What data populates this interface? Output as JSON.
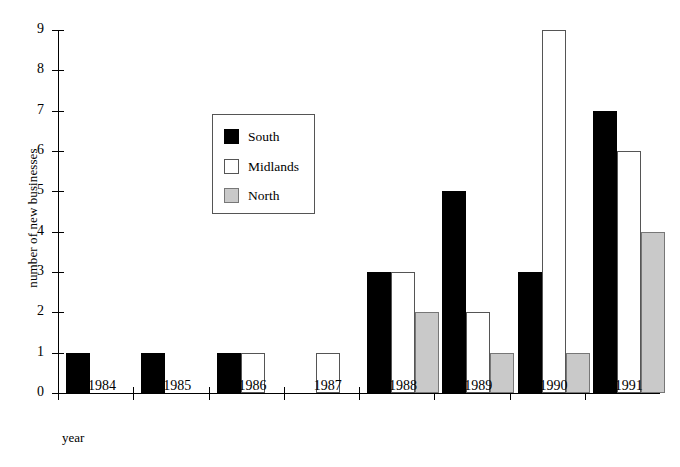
{
  "chart_data": {
    "type": "bar",
    "title": "",
    "xlabel": "year",
    "ylabel": "number of new businesses",
    "categories": [
      "1984",
      "1985",
      "1986",
      "1987",
      "1988",
      "1989",
      "1990",
      "1991"
    ],
    "series": [
      {
        "name": "South",
        "color": "#000000",
        "values": [
          1,
          1,
          1,
          0,
          3,
          5,
          3,
          7
        ]
      },
      {
        "name": "Midlands",
        "color": "#ffffff",
        "values": [
          0,
          0,
          1,
          1,
          3,
          2,
          9,
          6
        ]
      },
      {
        "name": "North",
        "color": "#c9c9c9",
        "values": [
          0,
          0,
          0,
          0,
          2,
          1,
          1,
          4
        ]
      }
    ],
    "ylim": [
      0,
      9
    ],
    "yticks": [
      0,
      1,
      2,
      3,
      4,
      5,
      6,
      7,
      8,
      9
    ],
    "ytick_labels": [
      "0",
      "1",
      "2",
      "3",
      "4",
      "5",
      "6",
      "7",
      "8",
      "9"
    ],
    "grid": false,
    "legend": {
      "position": "inside-upper-left",
      "entries": [
        {
          "label": "South",
          "swatch": "south-swatch"
        },
        {
          "label": "Midlands",
          "swatch": "midlands-swatch"
        },
        {
          "label": "North",
          "swatch": "north-swatch"
        }
      ]
    }
  }
}
